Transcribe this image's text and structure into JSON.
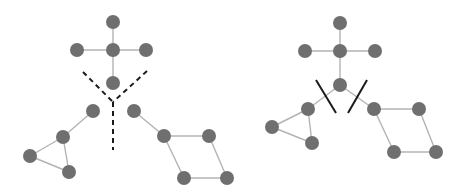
{
  "colors": {
    "node": "#6f6f6f",
    "edge": "#b3b3b3",
    "cut": "#1a1a1a",
    "background": "#ffffff"
  },
  "node_radius": 7,
  "left_panel": {
    "description": "Graph pieces separated by dashed Y-shaped cut lines",
    "nodes": [
      {
        "id": "a",
        "x": 113,
        "y": 22
      },
      {
        "id": "b",
        "x": 77,
        "y": 50
      },
      {
        "id": "c",
        "x": 113,
        "y": 50
      },
      {
        "id": "d",
        "x": 146,
        "y": 50
      },
      {
        "id": "e",
        "x": 113,
        "y": 83
      },
      {
        "id": "f",
        "x": 93,
        "y": 111
      },
      {
        "id": "g",
        "x": 63,
        "y": 137
      },
      {
        "id": "h",
        "x": 30,
        "y": 156
      },
      {
        "id": "i",
        "x": 69,
        "y": 172
      },
      {
        "id": "j",
        "x": 134,
        "y": 111
      },
      {
        "id": "k",
        "x": 164,
        "y": 136
      },
      {
        "id": "l",
        "x": 209,
        "y": 136
      },
      {
        "id": "m",
        "x": 184,
        "y": 178
      },
      {
        "id": "n",
        "x": 227,
        "y": 178
      }
    ],
    "edges": [
      [
        "a",
        "c"
      ],
      [
        "b",
        "c"
      ],
      [
        "c",
        "d"
      ],
      [
        "c",
        "e"
      ],
      [
        "f",
        "g"
      ],
      [
        "g",
        "h"
      ],
      [
        "g",
        "i"
      ],
      [
        "h",
        "i"
      ],
      [
        "j",
        "k"
      ],
      [
        "k",
        "l"
      ],
      [
        "k",
        "m"
      ],
      [
        "l",
        "n"
      ],
      [
        "m",
        "n"
      ]
    ],
    "dashed_cuts": [
      {
        "x1": 83,
        "y1": 72,
        "x2": 113,
        "y2": 102
      },
      {
        "x1": 147,
        "y1": 71,
        "x2": 113,
        "y2": 102
      },
      {
        "x1": 113,
        "y1": 102,
        "x2": 113,
        "y2": 150
      }
    ]
  },
  "right_panel": {
    "description": "Connected graph with two edges cut by solid lines",
    "nodes": [
      {
        "id": "a",
        "x": 340,
        "y": 23
      },
      {
        "id": "b",
        "x": 305,
        "y": 51
      },
      {
        "id": "c",
        "x": 340,
        "y": 51
      },
      {
        "id": "d",
        "x": 375,
        "y": 51
      },
      {
        "id": "e",
        "x": 340,
        "y": 85
      },
      {
        "id": "f",
        "x": 308,
        "y": 109
      },
      {
        "id": "g",
        "x": 272,
        "y": 127
      },
      {
        "id": "h",
        "x": 312,
        "y": 143
      },
      {
        "id": "j",
        "x": 374,
        "y": 109
      },
      {
        "id": "k",
        "x": 419,
        "y": 109
      },
      {
        "id": "l",
        "x": 394,
        "y": 152
      },
      {
        "id": "m",
        "x": 436,
        "y": 152
      }
    ],
    "edges": [
      [
        "a",
        "c"
      ],
      [
        "b",
        "c"
      ],
      [
        "c",
        "d"
      ],
      [
        "c",
        "e"
      ],
      [
        "e",
        "f"
      ],
      [
        "e",
        "j"
      ],
      [
        "f",
        "g"
      ],
      [
        "f",
        "h"
      ],
      [
        "g",
        "h"
      ],
      [
        "j",
        "k"
      ],
      [
        "j",
        "l"
      ],
      [
        "k",
        "m"
      ],
      [
        "l",
        "m"
      ]
    ],
    "solid_cuts": [
      {
        "x1": 316,
        "y1": 80,
        "x2": 336,
        "y2": 113
      },
      {
        "x1": 367,
        "y1": 80,
        "x2": 348,
        "y2": 113
      }
    ]
  }
}
